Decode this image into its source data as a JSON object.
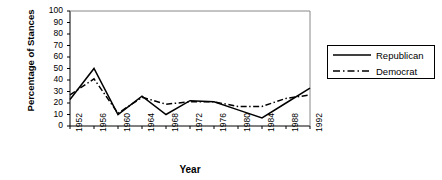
{
  "chart_data": {
    "type": "line",
    "title": "",
    "xlabel": "Year",
    "ylabel": "Percentage of Stances",
    "categories": [
      "1952",
      "1956",
      "1960",
      "1964",
      "1968",
      "1972",
      "1976",
      "1980",
      "1984",
      "1988",
      "1992"
    ],
    "ylim": [
      0,
      100
    ],
    "ytick_labels": [
      "100",
      "90",
      "80",
      "70",
      "60",
      "50",
      "40",
      "30",
      "20",
      "10",
      "0"
    ],
    "yticks": [
      100,
      90,
      80,
      70,
      60,
      50,
      40,
      30,
      20,
      10,
      0
    ],
    "grid": false,
    "legend_position": "right",
    "series": [
      {
        "name": "Republican",
        "style": "solid",
        "color": "#000000",
        "values": [
          23,
          50,
          10,
          26,
          10,
          22,
          21,
          14,
          7,
          20,
          33
        ]
      },
      {
        "name": "Democrat",
        "style": "dash-dot",
        "color": "#000000",
        "values": [
          27,
          41,
          11,
          25,
          19,
          21,
          21,
          17,
          17,
          24,
          27
        ]
      }
    ]
  },
  "axes": {
    "y_title": "Percentage of Stances",
    "x_title": "Year"
  },
  "legend": {
    "items": [
      {
        "label": "Republican"
      },
      {
        "label": "Democrat"
      }
    ]
  }
}
